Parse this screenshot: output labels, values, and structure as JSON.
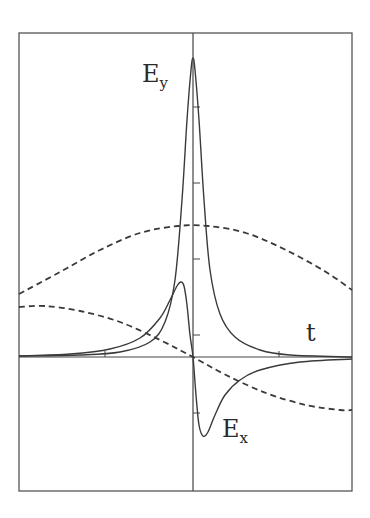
{
  "chart_data": {
    "type": "line",
    "title": "",
    "xlabel": "t",
    "ylabel": "",
    "grid": false,
    "legend": "none (inline labels)",
    "axes": {
      "frame": {
        "x0": 19,
        "y0": 33,
        "x1": 352,
        "y1": 491
      },
      "origin_px": {
        "x": 193,
        "y": 357
      },
      "x_ticks_px": [
        105,
        279
      ],
      "y_ticks_px": [
        107,
        183,
        259,
        335,
        413
      ]
    },
    "series": [
      {
        "name": "E_y",
        "style": "solid",
        "label": "E",
        "label_sub": "y",
        "points_px": [
          [
            19,
            356
          ],
          [
            80,
            355
          ],
          [
            120,
            352
          ],
          [
            150,
            342
          ],
          [
            165,
            322
          ],
          [
            175,
            280
          ],
          [
            182,
            200
          ],
          [
            187,
            120
          ],
          [
            191,
            70
          ],
          [
            193,
            58
          ],
          [
            195,
            70
          ],
          [
            199,
            120
          ],
          [
            204,
            200
          ],
          [
            210,
            270
          ],
          [
            220,
            314
          ],
          [
            235,
            337
          ],
          [
            260,
            350
          ],
          [
            290,
            355
          ],
          [
            352,
            357
          ]
        ]
      },
      {
        "name": "E_x",
        "style": "solid",
        "label": "E",
        "label_sub": "x",
        "points_px": [
          [
            19,
            356
          ],
          [
            70,
            354
          ],
          [
            110,
            349
          ],
          [
            140,
            338
          ],
          [
            160,
            318
          ],
          [
            170,
            300
          ],
          [
            177,
            286
          ],
          [
            181,
            282
          ],
          [
            184,
            286
          ],
          [
            187,
            305
          ],
          [
            190,
            335
          ],
          [
            193,
            357
          ],
          [
            196,
            395
          ],
          [
            199,
            425
          ],
          [
            203,
            436
          ],
          [
            208,
            432
          ],
          [
            215,
            415
          ],
          [
            225,
            395
          ],
          [
            240,
            380
          ],
          [
            260,
            370
          ],
          [
            300,
            362
          ],
          [
            352,
            359
          ]
        ]
      },
      {
        "name": "dashed_upper",
        "style": "dashed",
        "points_px": [
          [
            19,
            294
          ],
          [
            60,
            272
          ],
          [
            100,
            250
          ],
          [
            140,
            233
          ],
          [
            178,
            226
          ],
          [
            208,
            226
          ],
          [
            246,
            233
          ],
          [
            286,
            250
          ],
          [
            326,
            272
          ],
          [
            352,
            290
          ]
        ]
      },
      {
        "name": "dashed_lower",
        "style": "dashed",
        "points_px": [
          [
            19,
            307
          ],
          [
            45,
            306
          ],
          [
            80,
            311
          ],
          [
            120,
            322
          ],
          [
            160,
            340
          ],
          [
            193,
            357
          ],
          [
            226,
            375
          ],
          [
            266,
            393
          ],
          [
            306,
            405
          ],
          [
            340,
            410
          ],
          [
            352,
            410
          ]
        ]
      }
    ],
    "labels": {
      "ey_main": "E",
      "ey_sub": "y",
      "ex_main": "E",
      "ex_sub": "x",
      "t": "t"
    }
  }
}
